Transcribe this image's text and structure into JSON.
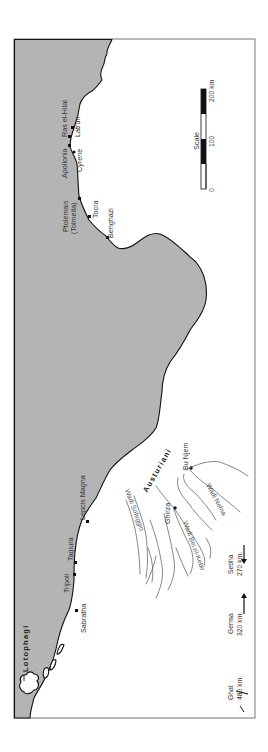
{
  "map": {
    "orientation": "rotated-90-counterclockwise",
    "sea_color": "#b4b4b4",
    "land_color": "#ffffff",
    "coastal_sites": [
      {
        "name": "Ras el-Hilal"
      },
      {
        "name": "Latrun"
      },
      {
        "name": "Apollonia"
      },
      {
        "name": "Cyrene"
      },
      {
        "name": "Ptolemais"
      },
      {
        "name": "(Tolmeita)"
      },
      {
        "name": "Tocra"
      },
      {
        "name": "Benghazi"
      },
      {
        "name": "Lepcis Magna"
      },
      {
        "name": "Tagiura"
      },
      {
        "name": "Tripoli"
      },
      {
        "name": "Sabratha"
      }
    ],
    "peoples": [
      {
        "name": "Lotophagi"
      },
      {
        "name": "Austuriani"
      }
    ],
    "inland_sites": [
      {
        "name": "Bu Njem"
      },
      {
        "name": "Ghirza"
      }
    ],
    "wadis": [
      {
        "name": "Wadi Sofeggin"
      },
      {
        "name": "Wadi Bei el-Kebir"
      },
      {
        "name": "Wadi Nefna"
      }
    ],
    "direction_markers": [
      {
        "place": "Sebha",
        "distance": "270 km."
      },
      {
        "place": "Germa",
        "distance": "320 km."
      },
      {
        "place": "Ghat",
        "distance": "480 km."
      }
    ],
    "scale": {
      "title": "Scale",
      "ticks": [
        "0",
        "100",
        "200 km"
      ]
    }
  }
}
